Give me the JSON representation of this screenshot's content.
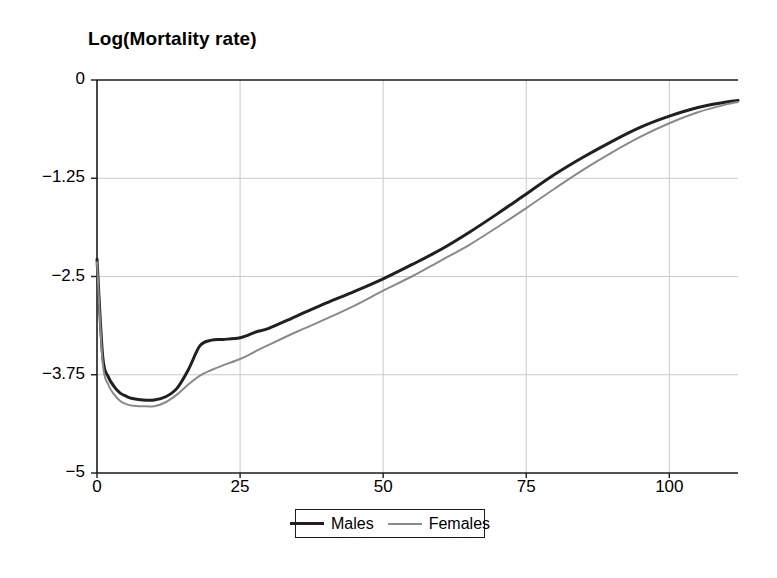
{
  "chart_data": {
    "type": "line",
    "title": "Log(Mortality rate)",
    "xlabel": "",
    "ylabel": "Log(Mortality rate)",
    "xlim": [
      0,
      112
    ],
    "ylim": [
      -5,
      0
    ],
    "xticks": [
      0,
      25,
      50,
      75,
      100
    ],
    "yticks": [
      0,
      -1.25,
      -2.5,
      -3.75,
      -5
    ],
    "xtick_labels": [
      "0",
      "25",
      "50",
      "75",
      "100"
    ],
    "ytick_labels": [
      "0",
      "−1.25",
      "−2.5",
      "−3.75",
      "−5"
    ],
    "grid": true,
    "legend_position": "below-center",
    "series": [
      {
        "name": "Males",
        "color": "#231f20",
        "width": 3,
        "x": [
          0,
          1,
          2,
          3,
          4,
          5,
          6,
          8,
          10,
          12,
          14,
          16,
          18,
          20,
          22,
          25,
          28,
          30,
          35,
          40,
          45,
          50,
          55,
          60,
          65,
          70,
          75,
          80,
          85,
          90,
          95,
          100,
          105,
          110,
          112
        ],
        "y": [
          -2.28,
          -3.52,
          -3.78,
          -3.9,
          -3.98,
          -4.02,
          -4.05,
          -4.07,
          -4.07,
          -4.03,
          -3.92,
          -3.68,
          -3.38,
          -3.31,
          -3.3,
          -3.28,
          -3.2,
          -3.16,
          -3.0,
          -2.84,
          -2.69,
          -2.53,
          -2.35,
          -2.16,
          -1.94,
          -1.7,
          -1.45,
          -1.2,
          -0.98,
          -0.78,
          -0.6,
          -0.46,
          -0.35,
          -0.28,
          -0.26
        ]
      },
      {
        "name": "Females",
        "color": "#8a8a8a",
        "width": 2,
        "x": [
          0,
          1,
          2,
          3,
          4,
          5,
          6,
          8,
          10,
          12,
          14,
          16,
          18,
          20,
          22,
          25,
          28,
          30,
          35,
          40,
          45,
          50,
          55,
          60,
          65,
          70,
          75,
          80,
          85,
          90,
          95,
          100,
          105,
          110,
          112
        ],
        "y": [
          -2.32,
          -3.6,
          -3.88,
          -4.0,
          -4.08,
          -4.12,
          -4.14,
          -4.15,
          -4.15,
          -4.1,
          -4.0,
          -3.87,
          -3.76,
          -3.69,
          -3.63,
          -3.55,
          -3.44,
          -3.37,
          -3.2,
          -3.04,
          -2.87,
          -2.68,
          -2.5,
          -2.3,
          -2.1,
          -1.87,
          -1.63,
          -1.38,
          -1.14,
          -0.92,
          -0.72,
          -0.55,
          -0.41,
          -0.31,
          -0.28
        ]
      }
    ]
  },
  "figure": {
    "title": "Log(Mortality rate)",
    "legend": {
      "entries": [
        {
          "label": "Males",
          "swatch": "solid-dark-line"
        },
        {
          "label": "Females",
          "swatch": "solid-gray-line"
        }
      ]
    },
    "axes": {
      "x_tick_labels": [
        "0",
        "25",
        "50",
        "75",
        "100"
      ],
      "y_tick_labels": [
        "0",
        "−1.25",
        "−2.5",
        "−3.75",
        "−5"
      ]
    },
    "colors": {
      "males": "#231f20",
      "females": "#8a8a8a",
      "axis": "#1b1b1b",
      "grid": "#c9c9c9",
      "background": "#ffffff"
    }
  }
}
